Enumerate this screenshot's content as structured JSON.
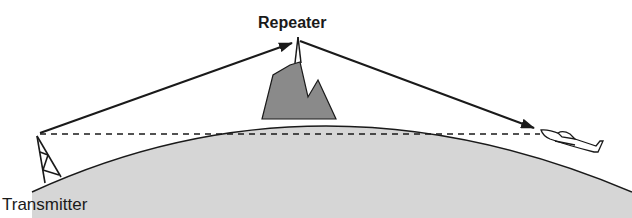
{
  "diagram": {
    "labels": {
      "repeater": "Repeater",
      "transmitter": "Transmitter"
    },
    "elements": [
      {
        "name": "earth-curve",
        "type": "shaded-arc"
      },
      {
        "name": "mountain",
        "type": "shaded-polygon"
      },
      {
        "name": "repeater-antenna",
        "type": "mast"
      },
      {
        "name": "transmitter-tower",
        "type": "lattice-tower"
      },
      {
        "name": "aircraft",
        "type": "airplane"
      },
      {
        "name": "signal-path-uplink",
        "from": "transmitter",
        "to": "repeater",
        "style": "solid-arrow"
      },
      {
        "name": "signal-path-downlink",
        "from": "repeater",
        "to": "aircraft",
        "style": "solid-arrow"
      },
      {
        "name": "line-of-sight",
        "from": "transmitter",
        "to": "aircraft",
        "style": "dashed"
      }
    ],
    "colors": {
      "earth": "#d6d6d6",
      "mountain": "#8a8a8a",
      "line": "#1a1a1a"
    }
  }
}
